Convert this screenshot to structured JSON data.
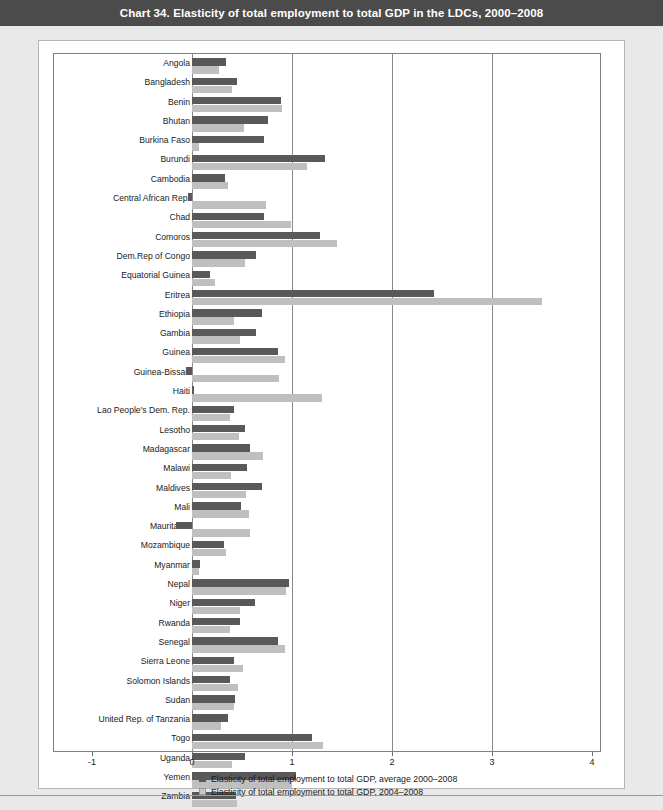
{
  "header": {
    "title": "Chart 34. Elasticity of total employment to total GDP in the LDCs, 2000–2008"
  },
  "colors": {
    "title_bar": "#4b4b4b",
    "page_background": "#e9e9e9",
    "panel_background": "#ffffff",
    "series_dark": "#59595b",
    "series_light": "#bfbfbf",
    "gridline": "#8a8a8a",
    "frame": "#808080"
  },
  "legend": {
    "position": "bottom",
    "entries": [
      {
        "swatch": "dark",
        "label": "Elasticity of total employment to total GDP, average 2000–2008"
      },
      {
        "swatch": "light",
        "label": "Elasticity of total employment to total GDP, 2004–2008"
      }
    ]
  },
  "axis": {
    "ticks": [
      "-1",
      "0",
      "1",
      "2",
      "3",
      "4"
    ],
    "tick_values": [
      -1,
      0,
      1,
      2,
      3,
      4
    ]
  },
  "chart_data": {
    "type": "bar",
    "orientation": "horizontal",
    "title": "Chart 34. Elasticity of total employment to total GDP in the LDCs, 2000–2008",
    "xlabel": "",
    "ylabel": "",
    "xlim": [
      -1,
      4
    ],
    "grid": true,
    "legend_position": "bottom",
    "categories": [
      "Angola",
      "Bangladesh",
      "Benin",
      "Bhutan",
      "Burkina Faso",
      "Burundi",
      "Cambodia",
      "Central African Rep.",
      "Chad",
      "Comoros",
      "Dem.Rep of Congo",
      "Equatorial Guinea",
      "Eritrea",
      "Ethiopia",
      "Gambia",
      "Guinea",
      "Guinea-Bissau",
      "Haiti",
      "Lao People's Dem. Rep.",
      "Lesotho",
      "Madagascar",
      "Malawi",
      "Maldives",
      "Mali",
      "Mauritania",
      "Mozambique",
      "Myanmar",
      "Nepal",
      "Niger",
      "Rwanda",
      "Senegal",
      "Sierra Leone",
      "Solomon Islands",
      "Sudan",
      "United Rep. of Tanzania",
      "Togo",
      "Uganda",
      "Yemen",
      "Zambia"
    ],
    "series": [
      {
        "name": "Elasticity of total employment to total GDP, average 2000–2008",
        "color": "#59595b",
        "values": [
          0.34,
          0.45,
          0.89,
          0.76,
          0.72,
          1.33,
          0.33,
          -0.04,
          0.72,
          1.28,
          0.64,
          0.18,
          2.42,
          0.7,
          0.64,
          0.86,
          -0.06,
          0.02,
          0.42,
          0.53,
          0.58,
          0.55,
          0.7,
          0.49,
          -0.16,
          0.32,
          0.08,
          0.97,
          0.63,
          0.48,
          0.86,
          0.42,
          0.38,
          0.43,
          0.36,
          1.2,
          0.53,
          1.04,
          0.44
        ]
      },
      {
        "name": "Elasticity of total employment to total GDP, 2004–2008",
        "color": "#bfbfbf",
        "values": [
          0.27,
          0.4,
          0.9,
          0.52,
          0.07,
          1.15,
          0.36,
          0.74,
          0.99,
          1.45,
          0.53,
          0.23,
          3.5,
          0.42,
          0.48,
          0.93,
          0.87,
          1.3,
          0.38,
          0.47,
          0.71,
          0.39,
          0.54,
          0.57,
          0.58,
          0.34,
          0.07,
          0.94,
          0.48,
          0.38,
          0.93,
          0.51,
          0.46,
          0.42,
          0.29,
          1.31,
          0.4,
          1.0,
          0.45
        ]
      }
    ]
  }
}
